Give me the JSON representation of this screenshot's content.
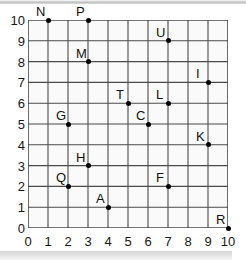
{
  "figure": {
    "title": "",
    "background_color": "#ffffff",
    "grid_line_color": "#4a4a4a",
    "cell_fill_color": "#fafafa",
    "point_color": "#000000",
    "label_color": "#111111"
  },
  "chart_data": {
    "type": "scatter",
    "title": "",
    "xlabel": "",
    "ylabel": "",
    "xlim": [
      0,
      10
    ],
    "ylim": [
      0,
      10
    ],
    "grid": true,
    "legend": "none",
    "x_ticks": [
      "0",
      "1",
      "2",
      "3",
      "4",
      "5",
      "6",
      "7",
      "8",
      "9",
      "10"
    ],
    "y_ticks": [
      "0",
      "1",
      "2",
      "3",
      "4",
      "5",
      "6",
      "7",
      "8",
      "9",
      "10"
    ],
    "point_labels": [
      "N",
      "P",
      "U",
      "M",
      "I",
      "T",
      "L",
      "G",
      "C",
      "K",
      "H",
      "Q",
      "F",
      "A",
      "R"
    ],
    "points": [
      {
        "label": "N",
        "x": 1,
        "y": 10,
        "label_pos": "above-left"
      },
      {
        "label": "P",
        "x": 3,
        "y": 10,
        "label_pos": "above-left"
      },
      {
        "label": "U",
        "x": 7,
        "y": 9,
        "label_pos": "above-left"
      },
      {
        "label": "M",
        "x": 3,
        "y": 8,
        "label_pos": "above-left"
      },
      {
        "label": "I",
        "x": 9,
        "y": 7,
        "label_pos": "above-left"
      },
      {
        "label": "T",
        "x": 5,
        "y": 6,
        "label_pos": "above-left"
      },
      {
        "label": "L",
        "x": 7,
        "y": 6,
        "label_pos": "above-left"
      },
      {
        "label": "G",
        "x": 2,
        "y": 5,
        "label_pos": "above-left"
      },
      {
        "label": "C",
        "x": 6,
        "y": 5,
        "label_pos": "above-left"
      },
      {
        "label": "K",
        "x": 9,
        "y": 4,
        "label_pos": "above-left"
      },
      {
        "label": "H",
        "x": 3,
        "y": 3,
        "label_pos": "above-left"
      },
      {
        "label": "Q",
        "x": 2,
        "y": 2,
        "label_pos": "above-left"
      },
      {
        "label": "F",
        "x": 7,
        "y": 2,
        "label_pos": "above-left"
      },
      {
        "label": "A",
        "x": 4,
        "y": 1,
        "label_pos": "above-left"
      },
      {
        "label": "R",
        "x": 10,
        "y": 0,
        "label_pos": "above-left"
      }
    ]
  }
}
